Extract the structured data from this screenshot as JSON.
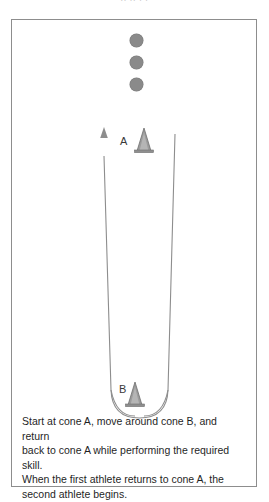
{
  "figure": {
    "top_fragment": "..  ..   .     .",
    "diagram_title": "Shuttle relay drill around two cones",
    "queue": {
      "label": "waiting athletes",
      "dot_color": "#8a8a8a",
      "count": 3,
      "dots": [
        {
          "name": "athlete-dot-1",
          "x": 129,
          "y": 33
        },
        {
          "name": "athlete-dot-2",
          "x": 129,
          "y": 55
        },
        {
          "name": "athlete-dot-3",
          "x": 129,
          "y": 77
        }
      ]
    },
    "cones": [
      {
        "id": "cone-a",
        "label": "A",
        "label_x": 119,
        "label_y": 135,
        "cone_x": 143,
        "cone_y": 127,
        "color": "#9a9a9a"
      },
      {
        "id": "cone-b",
        "label": "B",
        "label_x": 118,
        "label_y": 383,
        "cone_x": 133,
        "cone_y": 381,
        "color": "#9a9a9a"
      }
    ],
    "path": {
      "label": "travel path",
      "color": "#8d8d8d",
      "arrow_label": "return direction arrow",
      "arrow_x": 103,
      "arrow_top_y": 126,
      "left_line_x": 103,
      "right_line_x": 174,
      "curve_bottom_y": 406
    },
    "frame": {
      "color": "#8d8d8d",
      "x": 11,
      "y": 19,
      "width": 246,
      "height": 468
    }
  },
  "instructions": {
    "line1": "Start at cone A, move around cone B, and return",
    "line2": "back to cone A while performing the required skill.",
    "line3": "When the first athlete returns to cone A, the",
    "line4": "second athlete begins."
  }
}
